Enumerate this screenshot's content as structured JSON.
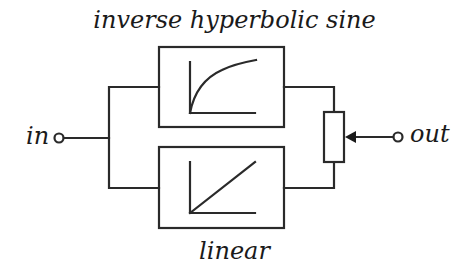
{
  "diagram": {
    "type": "signal-flow-block-diagram",
    "top_label": "inverse hyperbolic sine",
    "bottom_label": "linear",
    "input_label": "in",
    "output_label": "out",
    "blocks": [
      {
        "id": "asinh-block",
        "function": "inverse hyperbolic sine",
        "curve": "log-like concave rising curve"
      },
      {
        "id": "linear-block",
        "function": "linear",
        "curve": "straight diagonal line"
      }
    ],
    "components": [
      {
        "id": "input-terminal",
        "symbol": "open-circle"
      },
      {
        "id": "output-terminal",
        "symbol": "open-circle"
      },
      {
        "id": "potentiometer",
        "symbol": "resistor-with-wiper-arrow",
        "role": "crossfade between blocks"
      }
    ],
    "colors": {
      "stroke": "#2a2a2a",
      "background": "#ffffff"
    }
  }
}
